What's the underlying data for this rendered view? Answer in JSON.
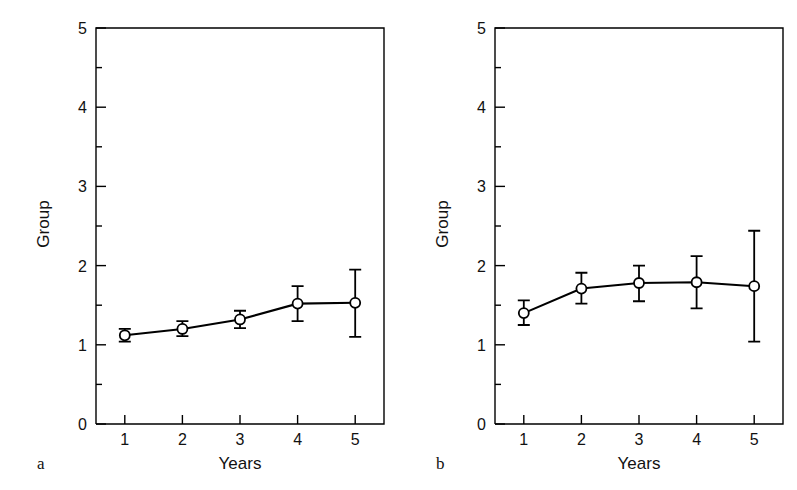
{
  "figure": {
    "background_color": "#ffffff",
    "line_color": "#000000",
    "marker_face_color": "#ffffff",
    "marker_edge_color": "#000000"
  },
  "panels": [
    {
      "letter": "a",
      "xlabel": "Years",
      "ylabel": "Group",
      "x_tick_labels": [
        "1",
        "2",
        "3",
        "4",
        "5"
      ],
      "y_tick_labels": [
        "0",
        "1",
        "2",
        "3",
        "4",
        "5"
      ]
    },
    {
      "letter": "b",
      "xlabel": "Years",
      "ylabel": "Group",
      "x_tick_labels": [
        "1",
        "2",
        "3",
        "4",
        "5"
      ],
      "y_tick_labels": [
        "0",
        "1",
        "2",
        "3",
        "4",
        "5"
      ]
    }
  ],
  "chart_data": [
    {
      "type": "line",
      "panel": "a",
      "title": "",
      "xlabel": "Years",
      "ylabel": "Group",
      "x": [
        1,
        2,
        3,
        4,
        5
      ],
      "categories": [
        "1",
        "2",
        "3",
        "4",
        "5"
      ],
      "values": [
        1.12,
        1.2,
        1.32,
        1.52,
        1.53
      ],
      "error_low": [
        1.04,
        1.11,
        1.21,
        1.3,
        1.1
      ],
      "error_high": [
        1.2,
        1.3,
        1.43,
        1.74,
        1.95
      ],
      "error_minus": [
        0.08,
        0.09,
        0.11,
        0.22,
        0.43
      ],
      "error_plus": [
        0.08,
        0.1,
        0.11,
        0.22,
        0.42
      ],
      "marker": "open-circle",
      "xlim": [
        0.5,
        5.5
      ],
      "ylim": [
        0,
        5
      ],
      "y_major_ticks": [
        0,
        1,
        2,
        3,
        4,
        5
      ],
      "y_minor_ticks": [
        0.5,
        1.5,
        2.5,
        3.5,
        4.5
      ],
      "x_major_ticks": [
        1,
        2,
        3,
        4,
        5
      ],
      "grid": false,
      "legend": "none"
    },
    {
      "type": "line",
      "panel": "b",
      "title": "",
      "xlabel": "Years",
      "ylabel": "Group",
      "x": [
        1,
        2,
        3,
        4,
        5
      ],
      "categories": [
        "1",
        "2",
        "3",
        "4",
        "5"
      ],
      "values": [
        1.4,
        1.71,
        1.78,
        1.79,
        1.74
      ],
      "error_low": [
        1.25,
        1.52,
        1.55,
        1.46,
        1.04
      ],
      "error_high": [
        1.56,
        1.91,
        2.0,
        2.12,
        2.44
      ],
      "error_minus": [
        0.15,
        0.19,
        0.23,
        0.33,
        0.7
      ],
      "error_plus": [
        0.16,
        0.2,
        0.22,
        0.33,
        0.7
      ],
      "marker": "open-circle",
      "xlim": [
        0.5,
        5.5
      ],
      "ylim": [
        0,
        5
      ],
      "y_major_ticks": [
        0,
        1,
        2,
        3,
        4,
        5
      ],
      "y_minor_ticks": [
        0.5,
        1.5,
        2.5,
        3.5,
        4.5
      ],
      "x_major_ticks": [
        1,
        2,
        3,
        4,
        5
      ],
      "grid": false,
      "legend": "none"
    }
  ]
}
